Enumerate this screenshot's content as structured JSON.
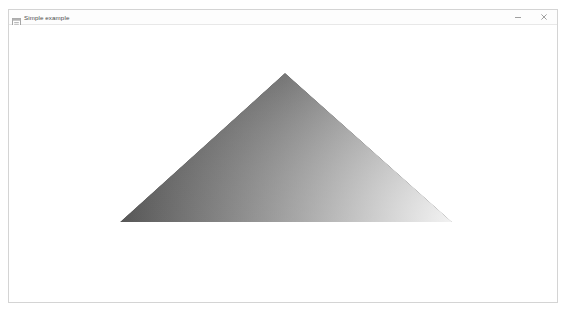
{
  "window": {
    "title": "Simple example",
    "icon": "app-window-icon",
    "controls": [
      {
        "name": "minimize",
        "glyph": "minimize-icon",
        "label": "–"
      },
      {
        "name": "close",
        "glyph": "close-icon",
        "label": "×"
      }
    ],
    "background_color": "#ffffff",
    "border_color": "#d4d4d4"
  },
  "canvas": {
    "label": "opengl-render-canvas",
    "background_color": "#ffffff",
    "scene": {
      "primitive": "triangle",
      "shading": "gouraud",
      "vertices": [
        {
          "name": "apex",
          "x": 285,
          "y": 73,
          "color": "#2b2b2b"
        },
        {
          "name": "bottom-left",
          "x": 120,
          "y": 222,
          "color": "#565656"
        },
        {
          "name": "bottom-right",
          "x": 452,
          "y": 222,
          "color": "#f2f2f2"
        }
      ]
    }
  }
}
